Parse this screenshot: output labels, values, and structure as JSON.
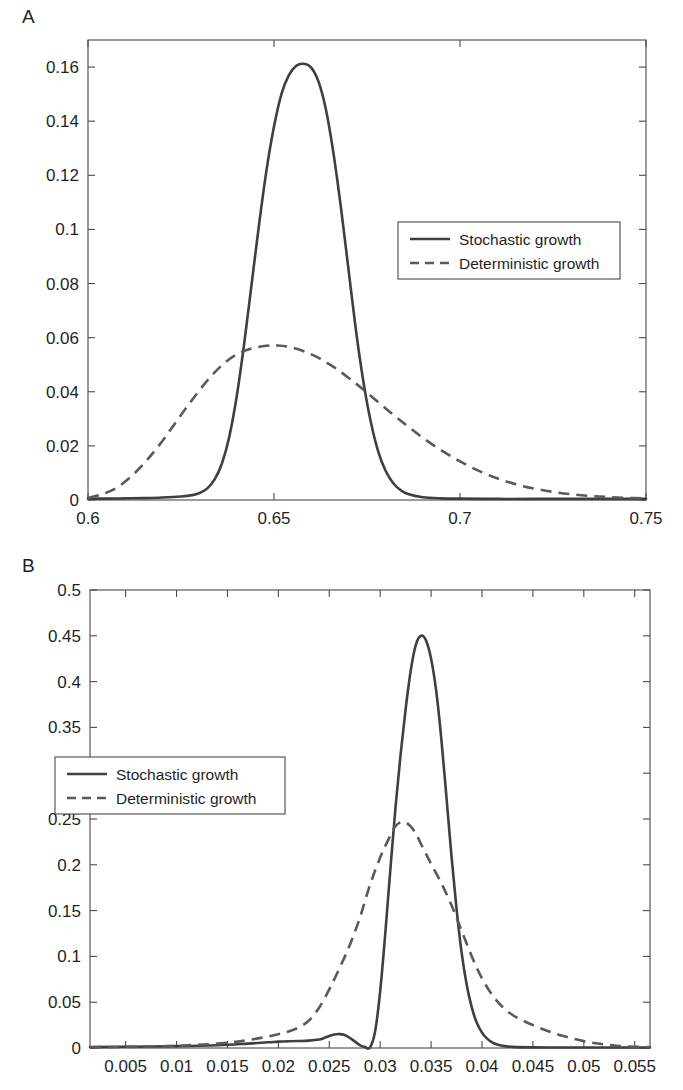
{
  "figure": {
    "panels": [
      {
        "label": "A",
        "legend_entries": [
          "Stochastic growth",
          "Deterministic growth"
        ]
      },
      {
        "label": "B",
        "legend_entries": [
          "Stochastic growth",
          "Deterministic growth"
        ]
      }
    ]
  },
  "chart_data": [
    {
      "type": "line",
      "panel": "A",
      "title": "",
      "xlabel": "",
      "ylabel": "",
      "xlim": [
        0.6,
        0.75
      ],
      "ylim": [
        0,
        0.17
      ],
      "grid": false,
      "legend_position": "upper right inside",
      "xticks": [
        0.6,
        0.65,
        0.7,
        0.75
      ],
      "xticklabels": [
        "0.6",
        "0.65",
        "0.7",
        "0.75"
      ],
      "yticks": [
        0,
        0.02,
        0.04,
        0.06,
        0.08,
        0.1,
        0.12,
        0.14,
        0.16
      ],
      "yticklabels": [
        "0",
        "0.02",
        "0.04",
        "0.06",
        "0.08",
        "0.1",
        "0.12",
        "0.14",
        "0.16"
      ],
      "series": [
        {
          "name": "Stochastic growth",
          "style": "solid",
          "color": "#3f3f3f",
          "x": [
            0.6,
            0.605,
            0.61,
            0.615,
            0.62,
            0.625,
            0.628,
            0.63,
            0.632,
            0.634,
            0.636,
            0.638,
            0.64,
            0.642,
            0.644,
            0.646,
            0.648,
            0.65,
            0.652,
            0.654,
            0.656,
            0.658,
            0.66,
            0.662,
            0.664,
            0.666,
            0.668,
            0.67,
            0.672,
            0.674,
            0.676,
            0.678,
            0.68,
            0.682,
            0.684,
            0.686,
            0.69,
            0.695,
            0.7,
            0.71,
            0.72,
            0.73,
            0.74,
            0.75
          ],
          "y": [
            0.0005,
            0.0005,
            0.0006,
            0.0007,
            0.0009,
            0.0013,
            0.0018,
            0.0026,
            0.0042,
            0.0075,
            0.0135,
            0.0235,
            0.0385,
            0.058,
            0.08,
            0.102,
            0.122,
            0.138,
            0.15,
            0.157,
            0.1605,
            0.1612,
            0.1598,
            0.1545,
            0.144,
            0.128,
            0.108,
            0.0855,
            0.063,
            0.044,
            0.029,
            0.018,
            0.0108,
            0.0063,
            0.0037,
            0.0022,
            0.001,
            0.0006,
            0.0005,
            0.0004,
            0.0004,
            0.0004,
            0.0004,
            0.0004
          ]
        },
        {
          "name": "Deterministic growth",
          "style": "dashed",
          "color": "#5a5a5a",
          "x": [
            0.6,
            0.604,
            0.608,
            0.612,
            0.616,
            0.62,
            0.624,
            0.628,
            0.632,
            0.636,
            0.64,
            0.644,
            0.648,
            0.651,
            0.654,
            0.658,
            0.662,
            0.666,
            0.67,
            0.674,
            0.678,
            0.682,
            0.686,
            0.69,
            0.694,
            0.698,
            0.702,
            0.706,
            0.71,
            0.715,
            0.72,
            0.725,
            0.73,
            0.735,
            0.74,
            0.745,
            0.75
          ],
          "y": [
            0.0008,
            0.0022,
            0.0048,
            0.0092,
            0.015,
            0.0218,
            0.0295,
            0.037,
            0.044,
            0.0498,
            0.0538,
            0.056,
            0.057,
            0.0571,
            0.0566,
            0.055,
            0.0525,
            0.0492,
            0.0452,
            0.0408,
            0.0362,
            0.0316,
            0.0272,
            0.023,
            0.0192,
            0.0158,
            0.0128,
            0.0102,
            0.008,
            0.0058,
            0.0042,
            0.003,
            0.0021,
            0.0015,
            0.0011,
            0.0008,
            0.0006
          ]
        }
      ]
    },
    {
      "type": "line",
      "panel": "B",
      "title": "",
      "xlabel": "",
      "ylabel": "",
      "xlim": [
        0.0015,
        0.0565
      ],
      "ylim": [
        0,
        0.5
      ],
      "grid": false,
      "legend_position": "middle left inside",
      "xticks": [
        0.005,
        0.01,
        0.015,
        0.02,
        0.025,
        0.03,
        0.035,
        0.04,
        0.045,
        0.05,
        0.055
      ],
      "xticklabels": [
        "0.005",
        "0.01",
        "0.015",
        "0.02",
        "0.025",
        "0.03",
        "0.035",
        "0.04",
        "0.045",
        "0.05",
        "0.055"
      ],
      "yticks": [
        0,
        0.05,
        0.1,
        0.15,
        0.2,
        0.25,
        0.3,
        0.35,
        0.4,
        0.45,
        0.5
      ],
      "yticklabels": [
        "0",
        "0.05",
        "0.1",
        "0.15",
        "0.2",
        "0.25",
        "0.3",
        "0.35",
        "0.4",
        "0.45",
        "0.5"
      ],
      "series": [
        {
          "name": "Stochastic growth",
          "style": "solid",
          "color": "#3f3f3f",
          "x": [
            0.0015,
            0.005,
            0.01,
            0.014,
            0.017,
            0.019,
            0.02,
            0.021,
            0.022,
            0.023,
            0.024,
            0.0245,
            0.025,
            0.0255,
            0.026,
            0.0265,
            0.027,
            0.0275,
            0.028,
            0.0285,
            0.029,
            0.0295,
            0.03,
            0.0305,
            0.031,
            0.0315,
            0.032,
            0.0325,
            0.033,
            0.0335,
            0.034,
            0.0345,
            0.035,
            0.0355,
            0.036,
            0.0365,
            0.037,
            0.0375,
            0.038,
            0.0385,
            0.039,
            0.0395,
            0.04,
            0.0405,
            0.041,
            0.0415,
            0.042,
            0.043,
            0.045,
            0.048,
            0.051,
            0.054,
            0.0565
          ],
          "y": [
            0.001,
            0.0014,
            0.002,
            0.003,
            0.0048,
            0.0062,
            0.007,
            0.0074,
            0.0076,
            0.008,
            0.0092,
            0.011,
            0.0132,
            0.0148,
            0.0152,
            0.0142,
            0.0112,
            0.0072,
            0.0032,
            0.001,
            0.0006,
            0.018,
            0.062,
            0.125,
            0.195,
            0.262,
            0.32,
            0.37,
            0.412,
            0.44,
            0.45,
            0.445,
            0.425,
            0.39,
            0.338,
            0.275,
            0.21,
            0.152,
            0.104,
            0.069,
            0.044,
            0.0272,
            0.0168,
            0.0102,
            0.0062,
            0.0038,
            0.0024,
            0.0012,
            0.0007,
            0.0005,
            0.0005,
            0.0005,
            0.0005
          ]
        },
        {
          "name": "Deterministic growth",
          "style": "dashed",
          "color": "#5a5a5a",
          "x": [
            0.0015,
            0.005,
            0.009,
            0.012,
            0.014,
            0.016,
            0.017,
            0.018,
            0.019,
            0.02,
            0.021,
            0.022,
            0.023,
            0.024,
            0.025,
            0.026,
            0.027,
            0.028,
            0.029,
            0.03,
            0.031,
            0.0315,
            0.032,
            0.0325,
            0.033,
            0.0335,
            0.034,
            0.0345,
            0.035,
            0.036,
            0.037,
            0.038,
            0.039,
            0.04,
            0.041,
            0.042,
            0.043,
            0.044,
            0.045,
            0.046,
            0.047,
            0.048,
            0.049,
            0.05,
            0.051,
            0.052,
            0.053,
            0.054,
            0.0565
          ],
          "y": [
            0.0008,
            0.0012,
            0.002,
            0.0034,
            0.0048,
            0.007,
            0.0086,
            0.0105,
            0.0125,
            0.015,
            0.018,
            0.0225,
            0.03,
            0.044,
            0.064,
            0.087,
            0.112,
            0.142,
            0.178,
            0.208,
            0.232,
            0.242,
            0.2465,
            0.246,
            0.242,
            0.234,
            0.223,
            0.212,
            0.201,
            0.18,
            0.156,
            0.128,
            0.1,
            0.076,
            0.058,
            0.045,
            0.036,
            0.03,
            0.025,
            0.0205,
            0.0165,
            0.013,
            0.01,
            0.0075,
            0.0055,
            0.004,
            0.0028,
            0.0018,
            0.001
          ]
        }
      ]
    }
  ]
}
